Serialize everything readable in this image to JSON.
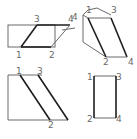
{
  "figures": [
    {
      "id": "figure-a",
      "description": "rectangle with inscribed parallelogram",
      "labels": {
        "p1": "1",
        "p2": "2",
        "p3": "3",
        "p4": "4"
      }
    },
    {
      "id": "figure-b",
      "description": "prism-like solid with slanted face",
      "labels": {
        "p1": "1",
        "p2": "2",
        "p3": "3",
        "p4": "4",
        "side4": "4"
      }
    },
    {
      "id": "figure-c",
      "description": "rectangle with two parallel diagonal lines",
      "labels": {
        "p1": "1",
        "p2": "2",
        "p3": "3"
      }
    },
    {
      "id": "figure-d",
      "description": "upright rectangle",
      "labels": {
        "p1": "1",
        "p2": "2",
        "p3": "3",
        "p4": "4"
      }
    }
  ],
  "caption": "",
  "colors": {
    "thin_line": "#6a6a6a",
    "thick_line": "#1e1e1e",
    "label": "#6a6a6a"
  }
}
